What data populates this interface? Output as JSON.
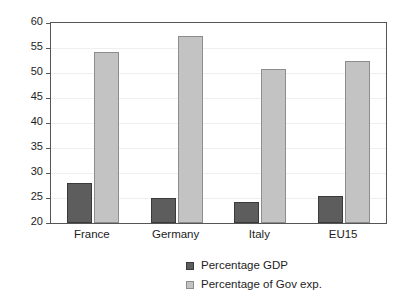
{
  "chart_data": {
    "type": "bar",
    "title": "",
    "subtitle": "",
    "xlabel": "",
    "ylabel": "",
    "categories": [
      "France",
      "Germany",
      "Italy",
      "EU15"
    ],
    "series": [
      {
        "name": "Percentage GDP",
        "color": "#5d5d5d",
        "values": [
          28.0,
          25.0,
          24.2,
          25.4
        ]
      },
      {
        "name": "Percentage of Gov exp.",
        "color": "#c3c3c3",
        "values": [
          54.2,
          57.4,
          50.8,
          52.5
        ]
      }
    ],
    "ylim": [
      20,
      60
    ],
    "yticks": [
      20,
      25,
      30,
      35,
      40,
      45,
      50,
      55,
      60
    ],
    "ytick_labels": [
      "20",
      "25",
      "30",
      "35",
      "40",
      "45",
      "50",
      "55",
      "60"
    ],
    "grid": true,
    "legend_position": "bottom"
  },
  "legend": {
    "items": [
      {
        "label": "Percentage GDP"
      },
      {
        "label": "Percentage of Gov exp."
      }
    ]
  }
}
